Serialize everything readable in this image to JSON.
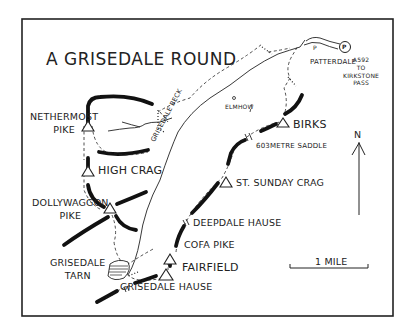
{
  "map": {
    "title": "A GRISEDALE ROUND",
    "colors": {
      "ink": "#222222",
      "paper": "#ffffff"
    },
    "summits": [
      {
        "name": "NETHERMOST PIKE",
        "line1": "NETHERMOST",
        "line2": "PIKE"
      },
      {
        "name": "HIGH CRAG"
      },
      {
        "name": "DOLLYWAGGON PIKE",
        "line1": "DOLLYWAGGON",
        "line2": "PIKE"
      },
      {
        "name": "FAIRFIELD"
      },
      {
        "name": "COFA PIKE"
      },
      {
        "name": "ST. SUNDAY CRAG"
      },
      {
        "name": "BIRKS"
      }
    ],
    "places": {
      "grisedale_tarn": {
        "line1": "GRISEDALE",
        "line2": "TARN"
      },
      "grisedale_hause": "GRISEDALE HAUSE",
      "deepdale_hause": "DEEPDALE HAUSE",
      "saddle": "603METRE SADDLE",
      "patterdale": "PATTERDALE",
      "elmhow": "ELMHOW",
      "grisedale_beck": "GRISEDALE BECK",
      "road": {
        "line1": "A592",
        "line2": "TO",
        "line3": "KIRKSTONE",
        "line4": "PASS"
      },
      "parking": "P",
      "p_small": "P"
    },
    "north_label": "N",
    "scale_label": "1 MILE"
  }
}
